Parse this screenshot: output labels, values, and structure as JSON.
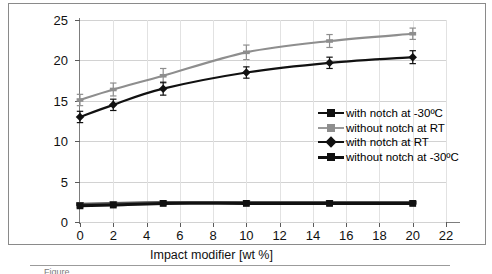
{
  "chart_data": {
    "type": "line",
    "title": "",
    "xlabel": "Impact modifier [wt %]",
    "ylabel": "Charpy impact strength [kJ/m²]",
    "xlim": [
      0,
      22
    ],
    "ylim": [
      0,
      25
    ],
    "xticks": [
      0,
      2,
      4,
      6,
      8,
      10,
      12,
      14,
      16,
      18,
      20,
      22
    ],
    "yticks": [
      0,
      5,
      10,
      15,
      20,
      25
    ],
    "grid": "horizontal-and-vertical",
    "legend_position": "center-right-inside",
    "x": [
      0,
      2,
      5,
      10,
      15,
      20
    ],
    "series": [
      {
        "name": "with notch at -30ºC",
        "marker": "square",
        "color": "#111111",
        "values": [
          2.0,
          2.1,
          2.3,
          2.3,
          2.3,
          2.3
        ],
        "errors": [
          0.2,
          0.2,
          0.2,
          0.2,
          0.2,
          0.2
        ]
      },
      {
        "name": "without notch at RT",
        "marker": "x",
        "color": "#8e8e8e",
        "values": [
          15.1,
          16.4,
          18.1,
          21.0,
          22.4,
          23.3
        ],
        "errors": [
          0.7,
          0.8,
          0.9,
          0.9,
          0.8,
          0.7
        ]
      },
      {
        "name": "with notch at RT",
        "marker": "diamond",
        "color": "#111111",
        "values": [
          13.0,
          14.5,
          16.5,
          18.5,
          19.7,
          20.4
        ],
        "errors": [
          0.7,
          0.7,
          0.8,
          0.7,
          0.7,
          0.8
        ]
      },
      {
        "name": "without notch at -30ºC",
        "marker": "dash",
        "color": "#555555",
        "values": [
          2.2,
          2.3,
          2.4,
          2.4,
          2.4,
          2.4
        ],
        "errors": [
          0.2,
          0.2,
          0.2,
          0.2,
          0.2,
          0.2
        ]
      }
    ]
  },
  "axes": {
    "y_title": "Charpy impact strength [kJ/m²]",
    "x_title": "Impact modifier [wt %]",
    "y_ticklabels": [
      "0",
      "5",
      "10",
      "15",
      "20",
      "25"
    ],
    "x_ticklabels": [
      "0",
      "2",
      "4",
      "6",
      "8",
      "10",
      "12",
      "14",
      "16",
      "18",
      "20",
      "22"
    ]
  },
  "legend": {
    "entries": [
      {
        "label": "with notch at -30ºC"
      },
      {
        "label": "without notch at RT"
      },
      {
        "label": "with notch at RT"
      },
      {
        "label": "without notch at -30ºC"
      }
    ]
  },
  "caption": {
    "partial_text": "Figure"
  }
}
